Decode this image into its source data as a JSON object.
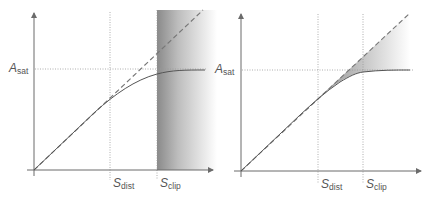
{
  "figure": {
    "colors": {
      "axis": "#6b6b6b",
      "curve": "#555555",
      "dashed": "#777777",
      "guide": "#999999",
      "shade_dark": "#8a8a8a",
      "background": "#ffffff"
    },
    "panels": [
      {
        "id": "left",
        "labels": {
          "y_level_main": "A",
          "y_level_sub": "sat",
          "x_mark1_main": "S",
          "x_mark1_sub": "dist",
          "x_mark2_main": "S",
          "x_mark2_sub": "clip"
        },
        "shading": "vertical band to the right of S_clip, darkest at S_clip fading rightward"
      },
      {
        "id": "right",
        "labels": {
          "y_level_main": "A",
          "y_level_sub": "sat",
          "x_mark1_main": "S",
          "x_mark1_sub": "dist",
          "x_mark2_main": "S",
          "x_mark2_sub": "clip"
        },
        "shading": "wedge between linear (dashed) line and saturating curve, fading to the right"
      }
    ]
  }
}
